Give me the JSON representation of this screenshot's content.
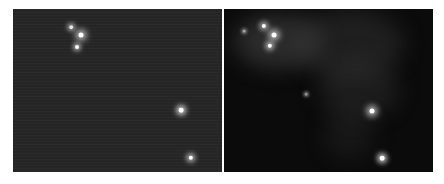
{
  "figure": {
    "panels": [
      {
        "id": "left",
        "description": "Raw astronomical exposure of a star field with grainy noise background",
        "background_color": "#262626",
        "stars": [
          {
            "name": "star-a",
            "brightness": 0.55
          },
          {
            "name": "star-b",
            "brightness": 1.0
          },
          {
            "name": "star-c",
            "brightness": 0.65
          },
          {
            "name": "star-d",
            "brightness": 0.9
          },
          {
            "name": "star-e",
            "brightness": 0.8
          }
        ]
      },
      {
        "id": "right",
        "description": "Processed image of the same field revealing faint nebulosity",
        "background_color": "#0b0b0b",
        "stars": [
          {
            "name": "star-a",
            "brightness": 0.75
          },
          {
            "name": "star-b",
            "brightness": 1.0
          },
          {
            "name": "star-c",
            "brightness": 0.8
          },
          {
            "name": "star-d",
            "brightness": 1.0
          },
          {
            "name": "star-e",
            "brightness": 0.9
          },
          {
            "name": "faint-star-1",
            "brightness": 0.25
          },
          {
            "name": "faint-star-2",
            "brightness": 0.2
          }
        ]
      }
    ]
  }
}
